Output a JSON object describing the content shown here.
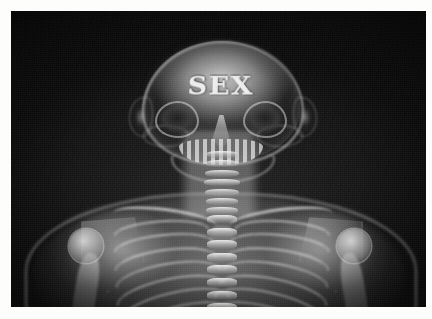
{
  "image": {
    "kind": "photograph",
    "subject": "x-ray-radiograph",
    "title": "X-ray of human head, neck and upper torso",
    "palette": {
      "frame": "#fdfdfc",
      "background": "#0d0d0d",
      "bone_bright": "#f4f4f4",
      "bone_mid": "#c4c4c4",
      "soft_tissue": "#8c8c8c",
      "shadow": "#141414"
    },
    "frame": {
      "border_top_px": 11,
      "border_left_px": 11,
      "border_right_px": 6,
      "border_bottom_px": 12
    }
  },
  "overlay_text": {
    "skull_label": "SEX"
  },
  "anatomy": {
    "head": {
      "cranium_label": "cranium",
      "features": [
        "eye-socket-left",
        "eye-socket-right",
        "nasal-cavity",
        "maxilla-teeth",
        "mandible",
        "ear-left",
        "ear-right",
        "zygomatic-arch-left",
        "zygomatic-arch-right"
      ]
    },
    "spine": {
      "cervical_vertebrae_count": 7,
      "thoracic_vertebrae_count": 8
    },
    "thorax": {
      "rib_pairs": 8,
      "parts": [
        "clavicle-left",
        "clavicle-right",
        "scapula-left",
        "scapula-right",
        "sternum"
      ]
    },
    "arms": {
      "parts": [
        "humeral-head-left",
        "humeral-head-right",
        "humerus-shaft-left",
        "humerus-shaft-right"
      ]
    }
  }
}
